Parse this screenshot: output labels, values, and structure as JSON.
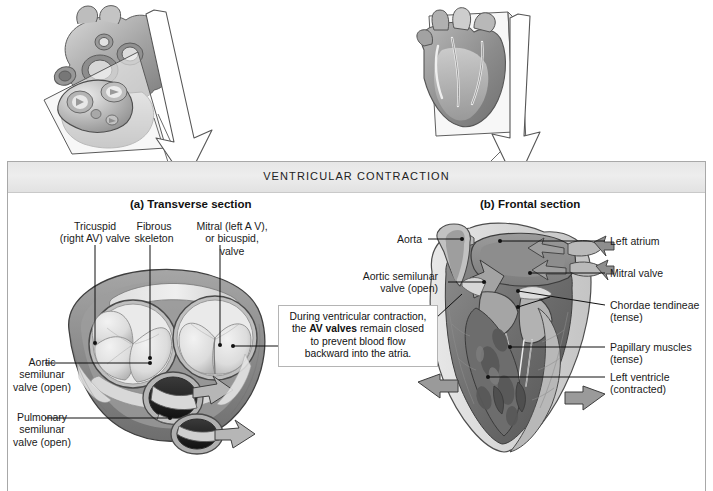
{
  "figure": {
    "banner_title": "VENTRICULAR CONTRACTION",
    "panel_border_color": "#a8a8a8"
  },
  "sections": {
    "a": {
      "title": "(a) Transverse section"
    },
    "b": {
      "title": "(b) Frontal section"
    }
  },
  "transverse_labels": {
    "tricuspid": "Tricuspid\n(right AV) valve",
    "tricuspid_l1": "Tricuspid",
    "tricuspid_l2": "(right AV) valve",
    "fibrous_l1": "Fibrous",
    "fibrous_l2": "skeleton",
    "mitral_l1": "Mitral (left A V),",
    "mitral_l2": "or bicuspid,",
    "mitral_l3": "valve",
    "aortic_l1": "Aortic",
    "aortic_l2": "semilunar",
    "aortic_l3": "valve (open)",
    "pulmonary_l1": "Pulmonary",
    "pulmonary_l2": "semilunar",
    "pulmonary_l3": "valve (open)"
  },
  "callout": {
    "line1": "During ventricular contraction,",
    "line2_pre": "the ",
    "line2_bold": "AV valves",
    "line2_post": " remain closed",
    "line3": "to prevent blood flow",
    "line4": "backward into the atria."
  },
  "frontal_labels": {
    "aorta": "Aorta",
    "aortic_semilunar_l1": "Aortic semilunar",
    "aortic_semilunar_l2": "valve (open)",
    "left_atrium": "Left atrium",
    "mitral_valve": "Mitral valve",
    "chordae_l1": "Chordae tendineae",
    "chordae_l2": "(tense)",
    "papillary_l1": "Papillary muscles",
    "papillary_l2": "(tense)",
    "left_ventricle_l1": "Left ventricle",
    "left_ventricle_l2": "(contracted)"
  },
  "colors": {
    "tissue_dark": "#6f6f6f",
    "tissue_mid": "#9a9a9a",
    "tissue_light": "#cfcfcf",
    "valve_pale": "#e3e3e3",
    "leader": "#111111",
    "arrow_gray": "#9b9b9b"
  }
}
